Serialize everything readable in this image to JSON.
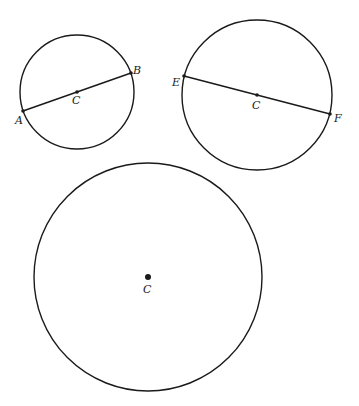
{
  "figure": {
    "stroke_color": "#1a1a1a",
    "background": "#ffffff"
  },
  "circles": [
    {
      "center_label": "C",
      "cx": 77,
      "cy": 92,
      "r": 57,
      "diameter": {
        "start_label": "A",
        "end_label": "B",
        "start": [
          23,
          111
        ],
        "end": [
          131,
          73
        ]
      }
    },
    {
      "center_label": "C",
      "cx": 257,
      "cy": 95,
      "r": 75,
      "diameter": {
        "start_label": "E",
        "end_label": "F",
        "start": [
          184,
          76
        ],
        "end": [
          330,
          114
        ]
      }
    },
    {
      "center_label": "C",
      "cx": 148,
      "cy": 277,
      "r": 114,
      "diameter": null
    }
  ]
}
